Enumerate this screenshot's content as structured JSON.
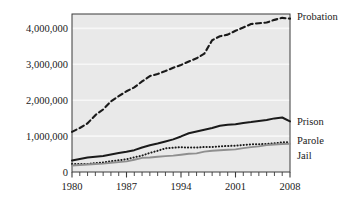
{
  "chart_data": {
    "type": "line",
    "title": "",
    "subtitle": "",
    "xlabel": "",
    "ylabel": "",
    "xlim": [
      1980,
      2008
    ],
    "ylim": [
      0,
      4400000
    ],
    "grid": true,
    "legend_position": "right-inline",
    "x_ticks_major": [
      "1980",
      "1987",
      "1994",
      "2001",
      "2008"
    ],
    "x_tick_values_major": [
      1980,
      1987,
      1994,
      2001,
      2008
    ],
    "x_tick_step_minor": 1,
    "y_ticks": [
      "0",
      "1,000,000",
      "2,000,000",
      "3,000,000",
      "4,000,000"
    ],
    "y_tick_values": [
      0,
      1000000,
      2000000,
      3000000,
      4000000
    ],
    "x": [
      1980,
      1981,
      1982,
      1983,
      1984,
      1985,
      1986,
      1987,
      1988,
      1989,
      1990,
      1991,
      1992,
      1993,
      1994,
      1995,
      1996,
      1997,
      1998,
      1999,
      2000,
      2001,
      2002,
      2003,
      2004,
      2005,
      2006,
      2007,
      2008
    ],
    "series": [
      {
        "name": "Probation",
        "style": "dashed",
        "color": "#1a1a1a",
        "width": 2.1,
        "label_x": 2008,
        "values": [
          1118097,
          1225934,
          1357264,
          1582947,
          1740948,
          1968712,
          2114621,
          2247158,
          2356483,
          2522125,
          2670234,
          2728472,
          2811611,
          2903061,
          2981022,
          3077861,
          3164996,
          3296513,
          3670441,
          3779922,
          3826209,
          3931731,
          4024067,
          4120012,
          4143792,
          4162536,
          4236800,
          4293163,
          4270917
        ]
      },
      {
        "name": "Prison",
        "style": "solid",
        "color": "#1a1a1a",
        "width": 2.0,
        "label_x": 2008,
        "values": [
          319598,
          360029,
          402914,
          423898,
          448264,
          487593,
          526436,
          562814,
          607766,
          683367,
          743382,
          792535,
          850566,
          909381,
          990147,
          1078542,
          1127528,
          1176564,
          1224469,
          1287172,
          1316333,
          1330007,
          1367547,
          1390279,
          1421345,
          1448344,
          1492973,
          1517867,
          1409166
        ]
      },
      {
        "name": "Parole",
        "style": "dotted",
        "color": "#1a1a1a",
        "width": 2.0,
        "label_x": 2008,
        "values": [
          220438,
          225539,
          224604,
          246440,
          266992,
          300203,
          325638,
          355505,
          407977,
          456803,
          531407,
          590442,
          658601,
          676100,
          690371,
          679421,
          679733,
          694787,
          696385,
          714457,
          723898,
          732333,
          753141,
          769925,
          771852,
          784408,
          798202,
          824365,
          828169
        ]
      },
      {
        "name": "Jail",
        "style": "solid",
        "color": "#8f8f8f",
        "width": 1.9,
        "label_x": 2008,
        "values": [
          182288,
          195085,
          209582,
          223551,
          234500,
          256615,
          274444,
          295873,
          341893,
          393303,
          405320,
          424129,
          441781,
          455500,
          479800,
          507044,
          518492,
          567079,
          592462,
          605943,
          621149,
          631240,
          665475,
          691301,
          713990,
          747529,
          765819,
          780174,
          785556
        ]
      }
    ]
  },
  "axis": {
    "y_labels": [
      "4,000,000",
      "3,000,000",
      "2,000,000",
      "1,000,000",
      "0"
    ],
    "x_labels": [
      "1980",
      "1987",
      "1994",
      "2001",
      "2008"
    ]
  },
  "legend": {
    "items": [
      {
        "label": "Probation"
      },
      {
        "label": "Prison"
      },
      {
        "label": "Parole"
      },
      {
        "label": "Jail"
      }
    ]
  },
  "colors": {
    "plot_background": "#e9e9e9",
    "gridline": "#f7f7f7",
    "axis": "#3a3a3a",
    "ink": "#1a1a1a",
    "jail_gray": "#8f8f8f",
    "page_background": "#ffffff"
  }
}
